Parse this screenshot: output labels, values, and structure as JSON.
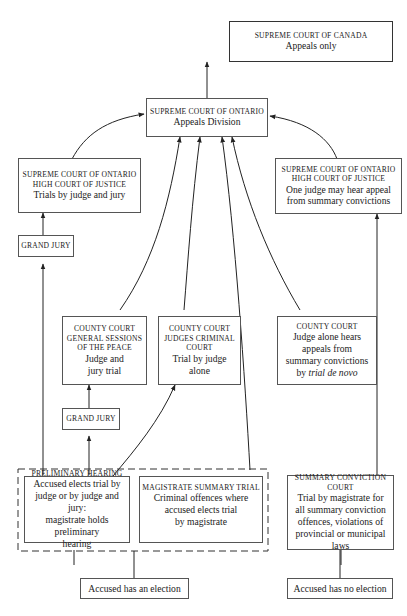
{
  "diagram": {
    "nodes": {
      "scc": {
        "title": "SUPREME COURT OF CANADA",
        "desc": "Appeals only"
      },
      "appeals": {
        "title": "SUPREME COURT OF ONTARIO",
        "desc": "Appeals Division"
      },
      "hcj_trial": {
        "title1": "SUPREME COURT OF ONTARIO",
        "title2": "HIGH COURT OF JUSTICE",
        "desc": "Trials by judge and jury"
      },
      "hcj_appeal": {
        "title1": "SUPREME COURT OF ONTARIO",
        "title2": "HIGH COURT OF JUSTICE",
        "desc1": "One judge may hear appeal",
        "desc2": "from summary convictions"
      },
      "grand_jury_top": {
        "title": "GRAND JURY"
      },
      "county_sessions": {
        "title1": "COUNTY COURT",
        "title2": "GENERAL SESSIONS",
        "title3": "OF THE PEACE",
        "desc1": "Judge and",
        "desc2": "jury trial"
      },
      "county_judges": {
        "title1": "COUNTY COURT",
        "title2": "JUDGES CRIMINAL",
        "title3": "COURT",
        "desc1": "Trial by judge",
        "desc2": "alone"
      },
      "county_appeal": {
        "title": "COUNTY COURT",
        "desc1": "Judge alone hears",
        "desc2": "appeals from",
        "desc3": "summary convictions",
        "desc4_prefix": "by ",
        "desc4_italic": "trial de novo"
      },
      "grand_jury_bottom": {
        "title": "GRAND JURY"
      },
      "preliminary": {
        "title": "PRELIMINARY HEARING",
        "desc1": "Accused elects trial by",
        "desc2": "judge or by judge and jury:",
        "desc3": "magistrate holds preliminary",
        "desc4": "hearing"
      },
      "magistrate": {
        "title": "MAGISTRATE SUMMARY TRIAL",
        "desc1": "Criminal offences where",
        "desc2": "accused elects trial",
        "desc3": "by magistrate"
      },
      "summary": {
        "title1": "SUMMARY CONVICTION",
        "title2": "COURT",
        "desc1": "Trial by magistrate for",
        "desc2": "all summary conviction",
        "desc3": "offences, violations of",
        "desc4": "provincial or municipal",
        "desc5": "laws"
      },
      "election": {
        "label": "Accused has an election"
      },
      "no_election": {
        "label": "Accused has no election"
      }
    },
    "edges": [
      {
        "from": "appeals",
        "to": "scc"
      },
      {
        "from": "hcj_trial",
        "to": "appeals"
      },
      {
        "from": "hcj_appeal",
        "to": "appeals"
      },
      {
        "from": "county_sessions",
        "to": "appeals"
      },
      {
        "from": "county_judges",
        "to": "appeals"
      },
      {
        "from": "magistrate",
        "to": "appeals"
      },
      {
        "from": "county_appeal",
        "to": "appeals"
      },
      {
        "from": "grand_jury_top",
        "to": "hcj_trial"
      },
      {
        "from": "preliminary",
        "to": "grand_jury_top"
      },
      {
        "from": "grand_jury_bottom",
        "to": "county_sessions"
      },
      {
        "from": "preliminary",
        "to": "grand_jury_bottom"
      },
      {
        "from": "preliminary",
        "to": "county_judges"
      },
      {
        "from": "summary",
        "to": "hcj_appeal"
      },
      {
        "from": "election",
        "to": "election_group"
      },
      {
        "from": "no_election",
        "to": "summary"
      }
    ],
    "colors": {
      "line": "#222222",
      "border": "#555555",
      "background": "#ffffff"
    }
  }
}
